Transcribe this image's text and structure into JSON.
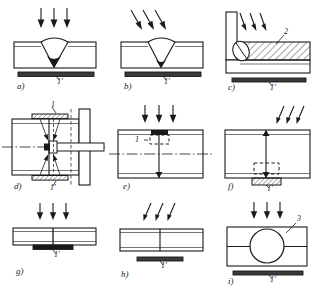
{
  "figure": {
    "panel_count": 9,
    "line_color": "#1a1a1a",
    "fill_color": "#ffffff",
    "background": "#ffffff"
  },
  "panels": [
    {
      "id": "a",
      "letter": "a)",
      "arrows": {
        "count": 3,
        "direction": "vertical-down"
      },
      "labels": [
        {
          "text": "1′",
          "target": "backing-strip"
        }
      ],
      "description": "V-groove butt weld in plate with flat backing strip below"
    },
    {
      "id": "b",
      "letter": "b)",
      "arrows": {
        "count": 3,
        "direction": "diagonal-down-right"
      },
      "labels": [
        {
          "text": "1′",
          "target": "backing-strip"
        }
      ],
      "description": "V-groove butt weld, inclined electrode, flat backing strip below"
    },
    {
      "id": "c",
      "letter": "c)",
      "arrows": {
        "count": 3,
        "direction": "diagonal-down-right"
      },
      "labels": [
        {
          "text": "2",
          "target": "hatched-block"
        },
        {
          "text": "1′",
          "target": "backing-strip"
        }
      ],
      "description": "T-joint fillet weld with hatched forming block 2 and backing strip 1"
    },
    {
      "id": "d",
      "letter": "d)",
      "arrows": {
        "count": 4,
        "direction": "inward-pairs"
      },
      "labels": [
        {
          "text": "1",
          "target": "upper-backing-plate"
        },
        {
          "text": "1′",
          "target": "lower-backing-plate"
        }
      ],
      "description": "Plan view of circumferential joint with shaft, centerline and two backing plates"
    },
    {
      "id": "e",
      "letter": "e)",
      "arrows": {
        "count": 3,
        "direction": "vertical-down"
      },
      "labels": [
        {
          "text": "1",
          "target": "insert-block"
        }
      ],
      "description": "Butt weld with dark insert block and dashed cavity outline, centerline through plate"
    },
    {
      "id": "f",
      "letter": "f)",
      "arrows": {
        "count": 3,
        "direction": "diagonal-down-left"
      },
      "labels": [
        {
          "text": "1′",
          "target": "hatched-backing-block"
        }
      ],
      "description": "Butt weld with dashed cavity and hatched backing block beneath"
    },
    {
      "id": "g",
      "letter": "g)",
      "arrows": {
        "count": 3,
        "direction": "vertical-down"
      },
      "labels": [
        {
          "text": "1′",
          "target": "backing-strip"
        }
      ],
      "description": "Thin plate butt weld with short backing strip attached below"
    },
    {
      "id": "h",
      "letter": "h)",
      "arrows": {
        "count": 3,
        "direction": "diagonal-down-right"
      },
      "labels": [
        {
          "text": "1′",
          "target": "backing-strip"
        }
      ],
      "description": "Thin plate butt weld, inclined electrode, detached backing strip"
    },
    {
      "id": "i",
      "letter": "i)",
      "arrows": {
        "count": 3,
        "direction": "vertical-down"
      },
      "labels": [
        {
          "text": "3",
          "target": "circular-insert"
        },
        {
          "text": "1′",
          "target": "backing-strip"
        }
      ],
      "description": "Butt weld with circular insert 3 inside plate and backing strip 1 below"
    }
  ]
}
